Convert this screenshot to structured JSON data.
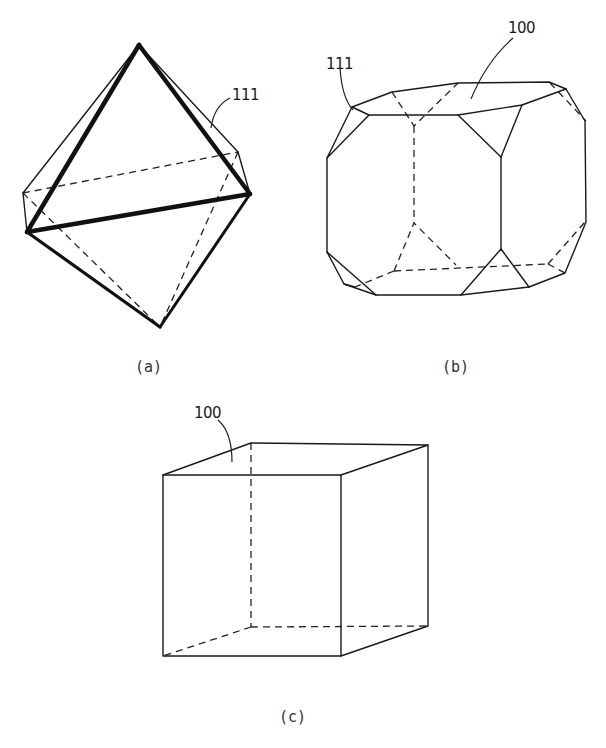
{
  "figures": [
    {
      "id": "a",
      "caption": "(a)",
      "shape": "octahedron",
      "reference_labels": [
        {
          "text": "111",
          "points_to": "octahedral {111} face"
        }
      ]
    },
    {
      "id": "b",
      "caption": "(b)",
      "shape": "cuboctahedron (truncated cube)",
      "reference_labels": [
        {
          "text": "111",
          "points_to": "corner {111} face"
        },
        {
          "text": "100",
          "points_to": "top {100} face"
        }
      ]
    },
    {
      "id": "c",
      "caption": "(c)",
      "shape": "cube",
      "reference_labels": [
        {
          "text": "100",
          "points_to": "cube {100} face"
        }
      ]
    }
  ],
  "colors": {
    "line": "#1a1a1a",
    "background": "#ffffff"
  }
}
